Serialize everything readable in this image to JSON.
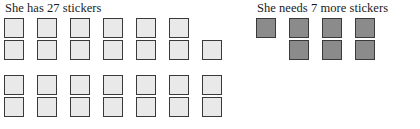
{
  "page": {
    "background_color": "#ffffff",
    "width": 420,
    "height": 129
  },
  "panels": {
    "left": {
      "heading": "She has 27 stickers",
      "sticker_count": 27,
      "sticker_fill_color": "#e9e9e9",
      "sticker_border_color": "#3a3a3a",
      "blocks": [
        {
          "name": "upper-block",
          "columns": [
            {
              "top": true,
              "bottom": true
            },
            {
              "top": true,
              "bottom": true
            },
            {
              "top": true,
              "bottom": true
            },
            {
              "top": true,
              "bottom": true
            },
            {
              "top": true,
              "bottom": true
            },
            {
              "top": true,
              "bottom": true
            },
            {
              "top": false,
              "bottom": true
            }
          ]
        },
        {
          "name": "lower-block",
          "columns": [
            {
              "top": true,
              "bottom": true
            },
            {
              "top": true,
              "bottom": true
            },
            {
              "top": true,
              "bottom": true
            },
            {
              "top": true,
              "bottom": true
            },
            {
              "top": true,
              "bottom": true
            },
            {
              "top": true,
              "bottom": true
            },
            {
              "top": true,
              "bottom": true
            }
          ]
        }
      ]
    },
    "right": {
      "heading": "She needs 7 more stickers",
      "sticker_count": 7,
      "sticker_fill_color": "#8b8b8b",
      "sticker_border_color": "#3a3a3a",
      "blocks": [
        {
          "name": "needed-block",
          "columns": [
            {
              "top": true,
              "bottom": false
            },
            {
              "top": true,
              "bottom": true
            },
            {
              "top": true,
              "bottom": true
            },
            {
              "top": true,
              "bottom": true
            }
          ]
        }
      ]
    }
  },
  "chart_data": {
    "type": "bar",
    "categories": [
      "She has 27 stickers",
      "She needs 7 more stickers"
    ],
    "values": [
      27,
      7
    ],
    "xlabel": "",
    "ylabel": "Number of stickers",
    "ylim": [
      0,
      27
    ],
    "legend": [
      "has (light squares)",
      "needs (dark squares)"
    ]
  }
}
